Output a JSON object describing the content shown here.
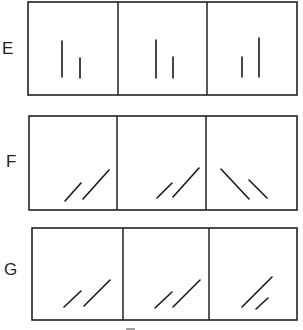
{
  "figure": {
    "rows": [
      {
        "label": "E",
        "panels": [
          {
            "segments": [
              {
                "orientation": "vertical",
                "relative_length": "long"
              },
              {
                "orientation": "vertical",
                "relative_length": "short"
              }
            ]
          },
          {
            "segments": [
              {
                "orientation": "vertical",
                "relative_length": "long"
              },
              {
                "orientation": "vertical",
                "relative_length": "short"
              }
            ]
          },
          {
            "segments": [
              {
                "orientation": "vertical",
                "relative_length": "short"
              },
              {
                "orientation": "vertical",
                "relative_length": "long"
              }
            ]
          }
        ]
      },
      {
        "label": "F",
        "panels": [
          {
            "segments": [
              {
                "orientation": "diagonal-up-right",
                "relative_length": "short"
              },
              {
                "orientation": "diagonal-up-right",
                "relative_length": "long"
              }
            ]
          },
          {
            "segments": [
              {
                "orientation": "diagonal-up-right",
                "relative_length": "short"
              },
              {
                "orientation": "diagonal-up-right",
                "relative_length": "long"
              }
            ]
          },
          {
            "segments": [
              {
                "orientation": "diagonal-down-right",
                "relative_length": "long"
              },
              {
                "orientation": "diagonal-down-right",
                "relative_length": "short"
              }
            ]
          }
        ]
      },
      {
        "label": "G",
        "panels": [
          {
            "segments": [
              {
                "orientation": "diagonal-up-right",
                "relative_length": "short"
              },
              {
                "orientation": "diagonal-up-right",
                "relative_length": "long"
              }
            ]
          },
          {
            "segments": [
              {
                "orientation": "diagonal-up-right",
                "relative_length": "short"
              },
              {
                "orientation": "diagonal-up-right",
                "relative_length": "long"
              }
            ]
          },
          {
            "segments": [
              {
                "orientation": "diagonal-up-right",
                "relative_length": "long"
              },
              {
                "orientation": "diagonal-up-right",
                "relative_length": "short"
              }
            ]
          }
        ]
      }
    ]
  }
}
